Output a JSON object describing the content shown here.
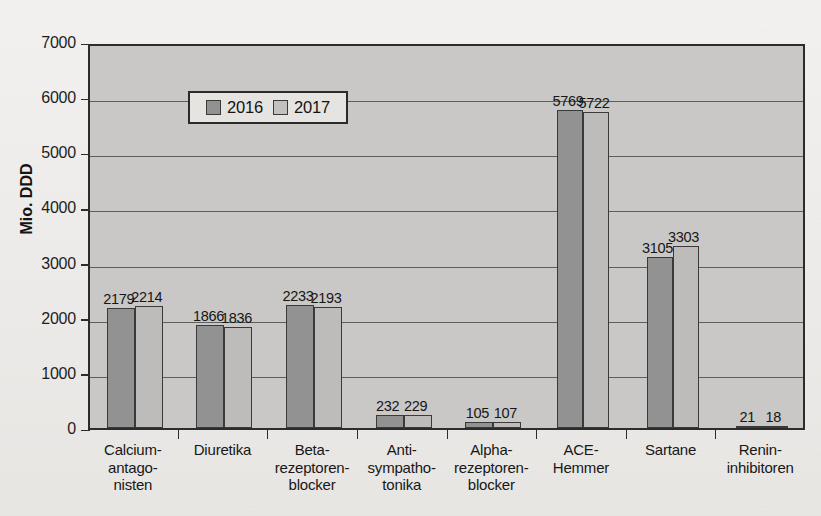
{
  "chart_data": {
    "type": "bar",
    "title": "",
    "xlabel": "",
    "ylabel": "Mio. DDD",
    "ylim": [
      0,
      7000
    ],
    "ytick_labels": [
      "0",
      "1000",
      "2000",
      "3000",
      "4000",
      "5000",
      "6000",
      "7000"
    ],
    "ytick_values": [
      0,
      1000,
      2000,
      3000,
      4000,
      5000,
      6000,
      7000
    ],
    "grid": true,
    "legend_position": "top-left",
    "categories": [
      "Calcium-\nantago-\nnisten",
      "Diuretika",
      "Beta-\nrezeptoren-\nblocker",
      "Anti-\nsympatho-\ntonika",
      "Alpha-\nrezeptoren-\nblocker",
      "ACE-\nHemmer",
      "Sartane",
      "Renin-\ninhibitoren"
    ],
    "category_lines": [
      [
        "Calcium-",
        "antago-",
        "nisten"
      ],
      [
        "Diuretika"
      ],
      [
        "Beta-",
        "rezeptoren-",
        "blocker"
      ],
      [
        "Anti-",
        "sympatho-",
        "tonika"
      ],
      [
        "Alpha-",
        "rezeptoren-",
        "blocker"
      ],
      [
        "ACE-",
        "Hemmer"
      ],
      [
        "Sartane"
      ],
      [
        "Renin-",
        "inhibitoren"
      ]
    ],
    "series": [
      {
        "name": "2016",
        "color": "#929292",
        "values": [
          2179,
          1866,
          2233,
          232,
          105,
          5769,
          3105,
          21
        ]
      },
      {
        "name": "2017",
        "color": "#bdbcba",
        "values": [
          2214,
          1836,
          2193,
          229,
          107,
          5722,
          3303,
          18
        ]
      }
    ]
  },
  "legend": {
    "items": [
      {
        "label": "2016",
        "color": "#929292"
      },
      {
        "label": "2017",
        "color": "#c2c1bf"
      }
    ]
  },
  "axes": {
    "y_axis_title": "Mio. DDD"
  }
}
